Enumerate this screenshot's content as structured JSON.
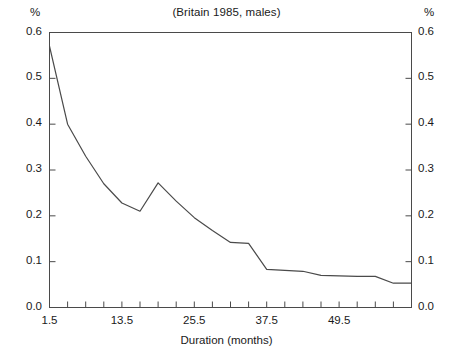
{
  "chart_data": {
    "type": "line",
    "title": "(Britain 1985, males)",
    "xlabel": "Duration (months)",
    "ylabel": "%",
    "ylabel_right": "%",
    "xlim": [
      1.5,
      61.5
    ],
    "ylim": [
      0.0,
      0.6
    ],
    "grid": false,
    "legend": null,
    "x_tick_labels": [
      "1.5",
      "13.5",
      "25.5",
      "37.5",
      "49.5"
    ],
    "x_tick_values": [
      1.5,
      13.5,
      25.5,
      37.5,
      49.5
    ],
    "x_minor_step": 3,
    "y_tick_labels": [
      "0.0",
      "0.1",
      "0.2",
      "0.3",
      "0.4",
      "0.5",
      "0.6"
    ],
    "y_tick_values": [
      0.0,
      0.1,
      0.2,
      0.3,
      0.4,
      0.5,
      0.6
    ],
    "series": [
      {
        "name": "exit rate",
        "x": [
          1.5,
          4.5,
          7.5,
          10.5,
          13.5,
          16.5,
          19.5,
          22.5,
          25.5,
          28.5,
          31.5,
          34.5,
          37.5,
          40.5,
          43.5,
          46.5,
          49.5,
          52.5,
          55.5,
          58.5,
          61.5
        ],
        "values": [
          0.57,
          0.4,
          0.33,
          0.27,
          0.228,
          0.21,
          0.272,
          0.232,
          0.196,
          0.168,
          0.142,
          0.14,
          0.083,
          0.081,
          0.079,
          0.07,
          0.069,
          0.068,
          0.068,
          0.053,
          0.053
        ]
      }
    ]
  },
  "axes": {
    "unit_left": "%",
    "unit_right": "%"
  }
}
